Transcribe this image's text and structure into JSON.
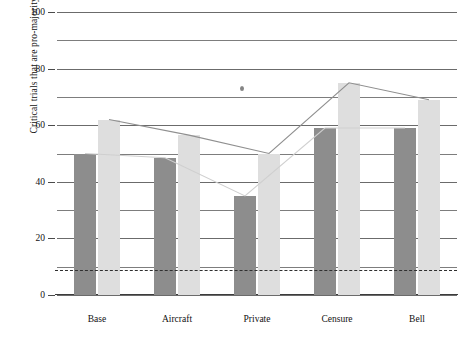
{
  "chart_data": {
    "type": "bar",
    "title": "",
    "xlabel": "",
    "ylabel": "Critical trials that are pro-majority (per cent)",
    "categories": [
      "Base",
      "Aircraft",
      "Private",
      "Censure",
      "Bell"
    ],
    "ylim": [
      0,
      100
    ],
    "yticks": [
      0,
      20,
      40,
      60,
      80,
      100
    ],
    "ytick_labels": [
      "0",
      "20",
      "40",
      "60",
      "80",
      "100"
    ],
    "gridlines": [
      0,
      10,
      20,
      30,
      40,
      50,
      60,
      70,
      80,
      90,
      100
    ],
    "grid": true,
    "legend": "none",
    "series": [
      {
        "name": "dark-bars",
        "kind": "bar",
        "color": "#8d8d8d",
        "values": [
          50,
          48.5,
          35,
          59,
          59
        ]
      },
      {
        "name": "light-bars",
        "kind": "bar",
        "color": "#dedede",
        "values": [
          62,
          56.5,
          50,
          75,
          69
        ]
      },
      {
        "name": "trend-line",
        "kind": "line",
        "color": "#8f8f8f",
        "values": [
          62,
          56.5,
          50,
          75,
          69
        ]
      }
    ],
    "reference_line": {
      "label": "chance",
      "value": 9,
      "style": "dashed",
      "color": "#2f2f2f"
    },
    "annotations": [
      {
        "name": "scan-speck",
        "x": 240,
        "y": 86
      }
    ]
  },
  "axis": {
    "y_title": "Critical trials that are pro-majority (per cent)"
  }
}
